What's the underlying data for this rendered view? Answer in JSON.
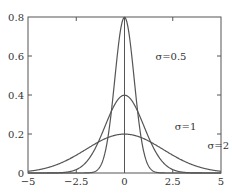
{
  "chart_data": {
    "type": "line",
    "title": "",
    "xlabel": "",
    "ylabel": "",
    "xlim": [
      -5,
      5
    ],
    "ylim": [
      0,
      0.8
    ],
    "x_ticks": [
      -5,
      -2.5,
      0,
      2.5,
      5
    ],
    "x_tick_labels": [
      "−5",
      "−2.5",
      "0",
      "2.5",
      "5"
    ],
    "y_ticks": [
      0,
      0.2,
      0.4,
      0.6,
      0.8
    ],
    "y_tick_labels": [
      "0",
      "0.2",
      "0.4",
      "0.6",
      "0.8"
    ],
    "grid": false,
    "legend": "none",
    "series_kind": "normal-pdf",
    "series": [
      {
        "name": "σ=0.5",
        "mean": 0,
        "sigma": 0.5,
        "peak": 0.798
      },
      {
        "name": "σ=1",
        "mean": 0,
        "sigma": 1,
        "peak": 0.399
      },
      {
        "name": "σ=2",
        "mean": 0,
        "sigma": 2,
        "peak": 0.199
      }
    ],
    "annotations": [
      {
        "text": "σ=0.5",
        "series": 0,
        "x": 1.6,
        "y": 0.6
      },
      {
        "text": "σ=1",
        "series": 1,
        "x": 2.6,
        "y": 0.24
      },
      {
        "text": "σ=2",
        "series": 2,
        "x": 4.3,
        "y": 0.14
      }
    ],
    "vertical_line": {
      "x": 0
    }
  }
}
